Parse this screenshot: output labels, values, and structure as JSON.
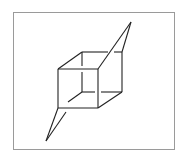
{
  "figure": {
    "colors": {
      "stroke": "#222222",
      "frame": "#9a9a9a",
      "background": "#ffffff"
    },
    "vertices": {
      "front_top_left": [
        58,
        69
      ],
      "front_top_right": [
        98,
        69
      ],
      "front_bottom_left": [
        58,
        108
      ],
      "front_bottom_right": [
        98,
        108
      ],
      "back_top_left": [
        82,
        52
      ],
      "back_top_right": [
        122,
        52
      ],
      "back_bottom_left": [
        82,
        92
      ],
      "back_bottom_right": [
        122,
        92
      ],
      "top_apex": [
        131,
        22
      ],
      "bottom_apex": [
        46,
        141
      ]
    }
  }
}
